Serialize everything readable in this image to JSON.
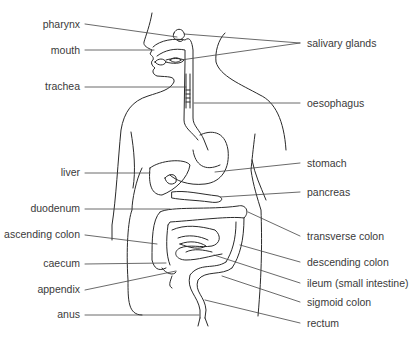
{
  "diagram": {
    "labels_left": [
      {
        "id": "pharynx",
        "text": "pharynx",
        "y": 24
      },
      {
        "id": "mouth",
        "text": "mouth",
        "y": 50
      },
      {
        "id": "trachea",
        "text": "trachea",
        "y": 86
      },
      {
        "id": "liver",
        "text": "liver",
        "y": 172
      },
      {
        "id": "duodenum",
        "text": "duodenum",
        "y": 208
      },
      {
        "id": "ascending-colon",
        "text": "ascending colon",
        "y": 234
      },
      {
        "id": "caecum",
        "text": "caecum",
        "y": 263
      },
      {
        "id": "appendix",
        "text": "appendix",
        "y": 289
      },
      {
        "id": "anus",
        "text": "anus",
        "y": 314
      }
    ],
    "labels_right": [
      {
        "id": "salivary-glands",
        "text": "salivary glands",
        "y": 43
      },
      {
        "id": "oesophagus",
        "text": "oesophagus",
        "y": 103
      },
      {
        "id": "stomach",
        "text": "stomach",
        "y": 163
      },
      {
        "id": "pancreas",
        "text": "pancreas",
        "y": 192
      },
      {
        "id": "transverse-colon",
        "text": "transverse colon",
        "y": 236
      },
      {
        "id": "descending-colon",
        "text": "descending colon",
        "y": 262
      },
      {
        "id": "ileum",
        "text": "ileum (small intestine)",
        "y": 283
      },
      {
        "id": "sigmoid-colon",
        "text": "sigmoid colon",
        "y": 302
      },
      {
        "id": "rectum",
        "text": "rectum",
        "y": 323
      }
    ],
    "colors": {
      "line": "#2a2a2a",
      "text": "#3a3a3a",
      "background": "#ffffff"
    }
  }
}
